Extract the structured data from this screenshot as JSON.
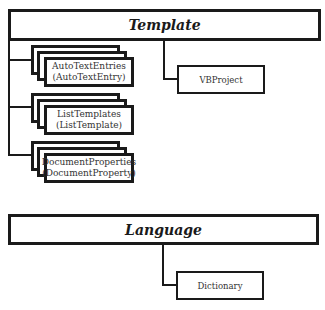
{
  "diagram": {
    "template": {
      "title": "Template",
      "collections": [
        {
          "name": "AutoTextEntries",
          "item": "(AutoTextEntry)"
        },
        {
          "name": "ListTemplates",
          "item": "(ListTemplate)"
        },
        {
          "name": "DocumentProperties",
          "item": "(DocumentProperty)"
        }
      ],
      "child": "VBProject"
    },
    "language": {
      "title": "Language",
      "child": "Dictionary"
    }
  }
}
